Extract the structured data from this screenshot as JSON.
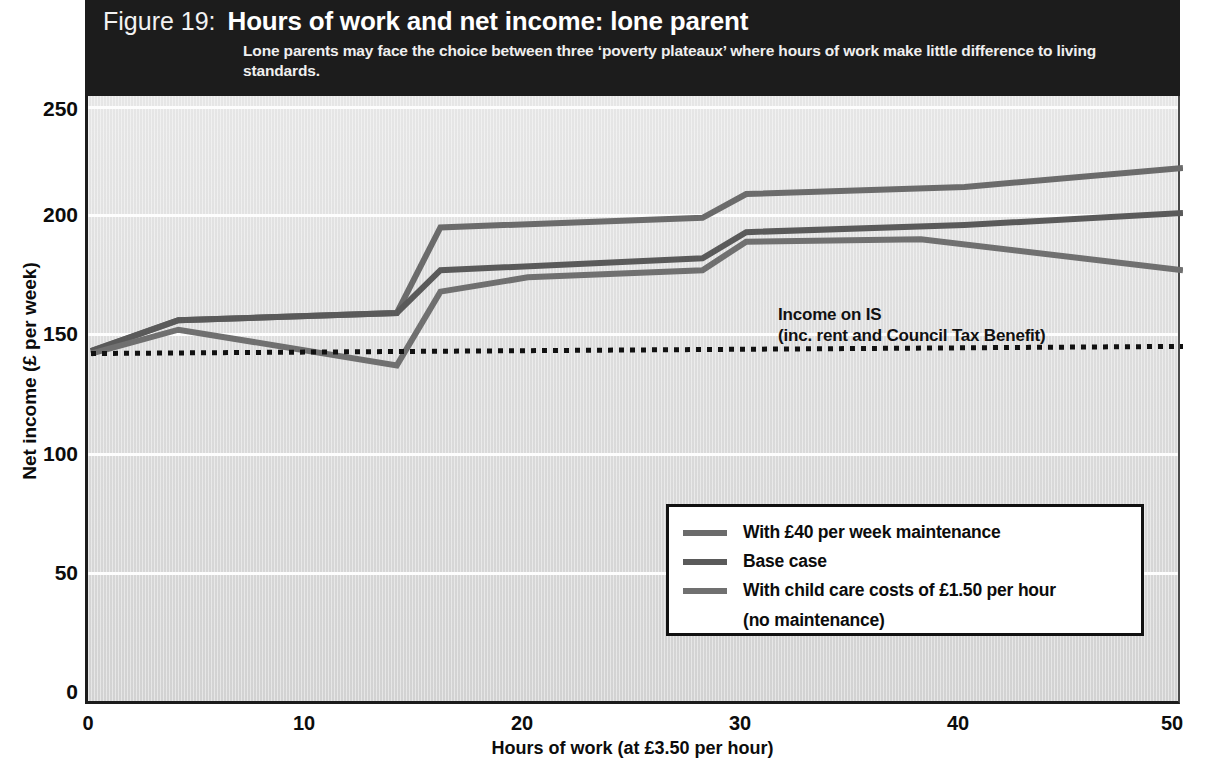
{
  "header": {
    "figure_number": "Figure 19:",
    "title": "Hours of work and net income: lone parent",
    "subtitle": "Lone parents may face the choice between three ‘poverty plateaux’ where hours of work make little difference to living standards.",
    "background_color": "#1c1c1c",
    "text_color": "#ffffff"
  },
  "annotation": {
    "line1": "Income on IS",
    "line2": "(inc. rent and Council Tax Benefit)"
  },
  "legend": {
    "items": [
      {
        "label": "With £40 per week maintenance",
        "color": "#6b6b6b"
      },
      {
        "label": "Base case",
        "color": "#5a5a5a"
      },
      {
        "label": "With child care costs of £1.50 per hour",
        "color": "#707070"
      },
      {
        "label": "(no maintenance)",
        "color": ""
      }
    ]
  },
  "chart_data": {
    "type": "line",
    "title": "Hours of work and net income: lone parent",
    "subtitle": "Lone parents may face the choice between three ‘poverty plateaux’ where hours of work make little difference to living standards.",
    "xlabel": "Hours of work (at £3.50 per hour)",
    "ylabel": "Net income (£ per week)",
    "xlim": [
      0,
      50
    ],
    "ylim": [
      0,
      250
    ],
    "xticks": [
      0,
      10,
      20,
      30,
      40,
      50
    ],
    "yticks": [
      0,
      50,
      100,
      150,
      200,
      250
    ],
    "grid": "horizontal-white",
    "legend_position": "inside-lower-right",
    "plot_background": "#dcdcdc",
    "series": [
      {
        "name": "With £40 per week maintenance",
        "color": "#6b6b6b",
        "points": [
          [
            0,
            147
          ],
          [
            4,
            160
          ],
          [
            14,
            163
          ],
          [
            16,
            199
          ],
          [
            28,
            203
          ],
          [
            30,
            213
          ],
          [
            40,
            216
          ],
          [
            50,
            224
          ]
        ]
      },
      {
        "name": "Base case",
        "color": "#5a5a5a",
        "points": [
          [
            0,
            147
          ],
          [
            4,
            160
          ],
          [
            14,
            163
          ],
          [
            16,
            181
          ],
          [
            28,
            186
          ],
          [
            30,
            197
          ],
          [
            40,
            200
          ],
          [
            50,
            205
          ]
        ]
      },
      {
        "name": "With child care costs of £1.50 per hour (no maintenance)",
        "color": "#707070",
        "points": [
          [
            0,
            146
          ],
          [
            4,
            156
          ],
          [
            14,
            141
          ],
          [
            16,
            172
          ],
          [
            20,
            178
          ],
          [
            28,
            181
          ],
          [
            30,
            193
          ],
          [
            38,
            194
          ],
          [
            50,
            181
          ]
        ]
      }
    ],
    "reference_line": {
      "name": "Income on IS (inc. rent and Council Tax Benefit)",
      "style": "dotted",
      "color": "#111111",
      "points": [
        [
          0,
          146
        ],
        [
          50,
          149
        ]
      ]
    }
  }
}
